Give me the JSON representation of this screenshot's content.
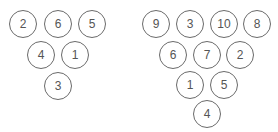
{
  "diagrams": [
    {
      "name": "left-triangle",
      "pins": [
        {
          "label": "2",
          "cx": 23,
          "cy": 24
        },
        {
          "label": "6",
          "cx": 58,
          "cy": 24
        },
        {
          "label": "5",
          "cx": 92,
          "cy": 24
        },
        {
          "label": "4",
          "cx": 41,
          "cy": 55
        },
        {
          "label": "1",
          "cx": 75,
          "cy": 55
        },
        {
          "label": "3",
          "cx": 58,
          "cy": 86
        }
      ]
    },
    {
      "name": "right-triangle",
      "pins": [
        {
          "label": "9",
          "cx": 156,
          "cy": 24
        },
        {
          "label": "3",
          "cx": 190,
          "cy": 24
        },
        {
          "label": "10",
          "cx": 224,
          "cy": 24
        },
        {
          "label": "8",
          "cx": 257,
          "cy": 24
        },
        {
          "label": "6",
          "cx": 173,
          "cy": 55
        },
        {
          "label": "7",
          "cx": 207,
          "cy": 55
        },
        {
          "label": "2",
          "cx": 240,
          "cy": 55
        },
        {
          "label": "1",
          "cx": 190,
          "cy": 85
        },
        {
          "label": "5",
          "cx": 224,
          "cy": 85
        },
        {
          "label": "4",
          "cx": 207,
          "cy": 114
        }
      ]
    }
  ],
  "colors": {
    "stroke": "#6a6a6a",
    "text": "#555555",
    "background": "#ffffff"
  }
}
